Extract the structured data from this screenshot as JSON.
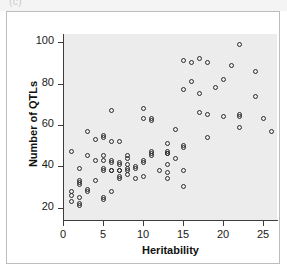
{
  "scan": {
    "top_caption": "(c)"
  },
  "chart_data": {
    "type": "scatter",
    "title": "",
    "xlabel": "Heritability",
    "ylabel": "Number of QTLs",
    "xlim": [
      -1,
      27
    ],
    "ylim": [
      14,
      104
    ],
    "xticks": [
      0,
      5,
      10,
      15,
      20,
      25
    ],
    "yticks": [
      20,
      40,
      60,
      80,
      100
    ],
    "grid": false,
    "legend": null,
    "marker": "open-circle",
    "panel_background": "#ececec",
    "marker_color": "#2b2b2b",
    "points": [
      [
        1,
        47
      ],
      [
        1,
        28
      ],
      [
        1,
        26
      ],
      [
        1,
        23
      ],
      [
        2,
        39
      ],
      [
        2,
        33
      ],
      [
        2,
        32
      ],
      [
        2,
        31
      ],
      [
        2,
        25
      ],
      [
        2,
        22
      ],
      [
        2,
        21
      ],
      [
        3,
        57
      ],
      [
        3,
        45
      ],
      [
        3,
        29
      ],
      [
        3,
        28
      ],
      [
        4,
        53
      ],
      [
        4,
        43
      ],
      [
        4,
        33
      ],
      [
        5,
        55
      ],
      [
        5,
        54
      ],
      [
        5,
        45
      ],
      [
        5,
        43
      ],
      [
        5,
        39
      ],
      [
        5,
        38
      ],
      [
        5,
        25
      ],
      [
        5,
        24
      ],
      [
        6,
        67
      ],
      [
        6,
        52
      ],
      [
        6,
        43
      ],
      [
        6,
        42
      ],
      [
        6,
        38
      ],
      [
        6,
        38
      ],
      [
        6,
        28
      ],
      [
        7,
        52
      ],
      [
        7,
        42
      ],
      [
        7,
        41
      ],
      [
        7,
        38
      ],
      [
        7,
        38
      ],
      [
        7,
        35
      ],
      [
        7,
        34
      ],
      [
        8,
        45
      ],
      [
        8,
        44
      ],
      [
        8,
        41
      ],
      [
        8,
        39
      ],
      [
        8,
        38
      ],
      [
        8,
        36
      ],
      [
        9,
        40
      ],
      [
        9,
        39
      ],
      [
        9,
        34
      ],
      [
        10,
        68
      ],
      [
        10,
        63
      ],
      [
        10,
        43
      ],
      [
        10,
        42
      ],
      [
        10,
        35
      ],
      [
        11,
        63
      ],
      [
        11,
        62
      ],
      [
        11,
        47
      ],
      [
        11,
        46
      ],
      [
        11,
        45
      ],
      [
        12,
        38
      ],
      [
        13,
        51
      ],
      [
        13,
        47
      ],
      [
        13,
        46
      ],
      [
        13,
        46
      ],
      [
        13,
        41
      ],
      [
        13,
        37
      ],
      [
        13,
        34
      ],
      [
        14,
        58
      ],
      [
        14,
        44
      ],
      [
        15,
        91
      ],
      [
        15,
        77
      ],
      [
        15,
        50
      ],
      [
        15,
        49
      ],
      [
        15,
        38
      ],
      [
        15,
        30
      ],
      [
        16,
        90
      ],
      [
        16,
        81
      ],
      [
        17,
        92
      ],
      [
        17,
        75
      ],
      [
        17,
        66
      ],
      [
        18,
        90
      ],
      [
        18,
        65
      ],
      [
        18,
        54
      ],
      [
        19,
        78
      ],
      [
        20,
        82
      ],
      [
        20,
        64
      ],
      [
        21,
        89
      ],
      [
        22,
        99
      ],
      [
        22,
        65
      ],
      [
        22,
        64
      ],
      [
        22,
        59
      ],
      [
        24,
        86
      ],
      [
        24,
        74
      ],
      [
        25,
        63
      ],
      [
        26,
        57
      ]
    ]
  }
}
